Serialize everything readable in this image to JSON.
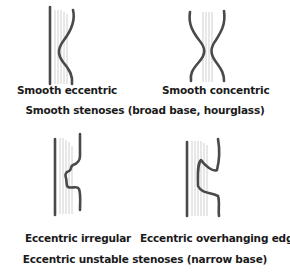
{
  "figure": {
    "top_section": {
      "panels": [
        {
          "id": "smooth-eccentric",
          "label": "Smooth eccentric"
        },
        {
          "id": "smooth-concentric",
          "label": "Smooth concentric"
        }
      ],
      "caption": "Smooth stenoses (broad base, hourglass)"
    },
    "bottom_section": {
      "panels": [
        {
          "id": "eccentric-irregular",
          "label": "Eccentric irregular"
        },
        {
          "id": "eccentric-overhanging-edges",
          "label": "Eccentric overhanging edges"
        }
      ],
      "caption": "Eccentric unstable stenoses (narrow base)"
    },
    "colors": {
      "vessel_wall": "#4a4a4a",
      "flow_lines": "#c4c4c4",
      "text": "#1a1a1a",
      "background": "#ffffff"
    }
  }
}
